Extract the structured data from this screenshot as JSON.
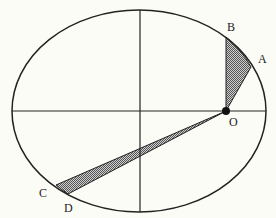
{
  "diagram": {
    "colors": {
      "background": "#fcfcf7",
      "line": "#222222",
      "fill_dot_dark": "#555555",
      "fill_dot_light": "#cfcfcf"
    },
    "ellipse": {
      "cx": 139,
      "cy": 111,
      "rx": 127,
      "ry": 101
    },
    "axes": {
      "horizontal": {
        "x1": 12,
        "y1": 111,
        "x2": 266,
        "y2": 111
      },
      "vertical": {
        "x1": 140,
        "y1": 10,
        "x2": 140,
        "y2": 212
      }
    },
    "focus": {
      "label": "O",
      "x": 226,
      "y": 111,
      "label_x": 229,
      "label_y": 126
    },
    "points": [
      {
        "label": "A",
        "x": 251,
        "y": 67,
        "label_x": 258,
        "label_y": 63
      },
      {
        "label": "B",
        "x": 226,
        "y": 37,
        "label_x": 227,
        "label_y": 31
      },
      {
        "label": "C",
        "x": 56,
        "y": 185,
        "label_x": 39,
        "label_y": 197
      },
      {
        "label": "D",
        "x": 68,
        "y": 194,
        "label_x": 64,
        "label_y": 212
      }
    ],
    "sectors": [
      {
        "name": "sector-OAB",
        "from": "A",
        "to": "B"
      },
      {
        "name": "sector-OCD",
        "from": "C",
        "to": "D"
      }
    ]
  }
}
